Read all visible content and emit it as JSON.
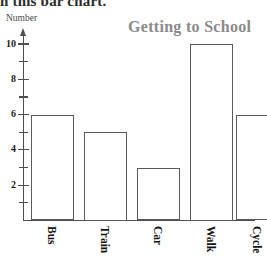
{
  "header": {
    "cut_off_text": "n this bar chart."
  },
  "chart_data": {
    "type": "bar",
    "title": "Getting to School",
    "xlabel": "",
    "ylabel": "Number",
    "categories": [
      "Bus",
      "Train",
      "Car",
      "Walk",
      "Cycle"
    ],
    "values": [
      6,
      5,
      3,
      10,
      6
    ],
    "ylim": [
      0,
      10.5
    ],
    "y_major_ticks": [
      2,
      4,
      6,
      8,
      10
    ],
    "y_major_tick_labels": [
      "2",
      "4",
      "6",
      "8",
      "10"
    ],
    "y_minor_ticks": [
      1,
      3,
      5,
      7,
      9
    ],
    "grid": false,
    "legend": false,
    "bar_fill": "#ffffff",
    "bar_stroke": "#5a5a5a",
    "axis_color": "#4f4f4f",
    "title_color": "#8a8a8a",
    "label_color": "#141414",
    "background": "#ffffff",
    "y_axis_has_arrow": true,
    "category_label_rotation": 90
  }
}
